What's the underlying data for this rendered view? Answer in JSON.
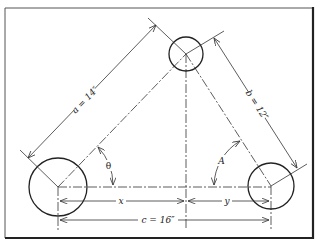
{
  "diagram": {
    "labels": {
      "side_a": "a = 14″",
      "side_b": "b = 12″",
      "side_c": "c = 16″",
      "dim_x": "x",
      "dim_y": "y",
      "angle_theta": "θ",
      "angle_A": "A"
    },
    "circles": [
      {
        "name": "left-hole",
        "cx": 58,
        "cy": 187,
        "r": 29
      },
      {
        "name": "top-hole",
        "cx": 186,
        "cy": 54,
        "r": 17
      },
      {
        "name": "right-hole",
        "cx": 271,
        "cy": 186,
        "r": 23
      }
    ],
    "colors": {
      "line": "#333333",
      "background": "#ffffff"
    }
  }
}
